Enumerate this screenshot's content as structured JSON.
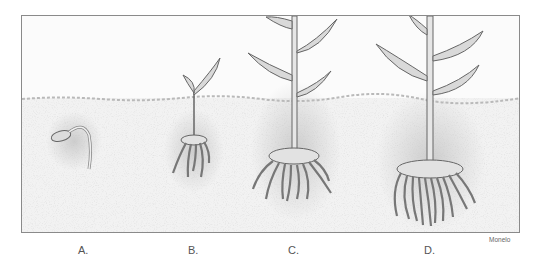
{
  "figure": {
    "ground_line_y": 97,
    "stages": [
      {
        "id": "A",
        "label": "A.",
        "x": 83
      },
      {
        "id": "B",
        "label": "B.",
        "x": 193
      },
      {
        "id": "C",
        "label": "C.",
        "x": 293
      },
      {
        "id": "D",
        "label": "D.",
        "x": 429
      }
    ],
    "credit": "Monelo",
    "colors": {
      "frame": "#8a8a8a",
      "soil": "#c8c8c8",
      "plant_stroke": "#555555",
      "leaf_fill": "#d6d6d6",
      "label": "#555555"
    }
  }
}
